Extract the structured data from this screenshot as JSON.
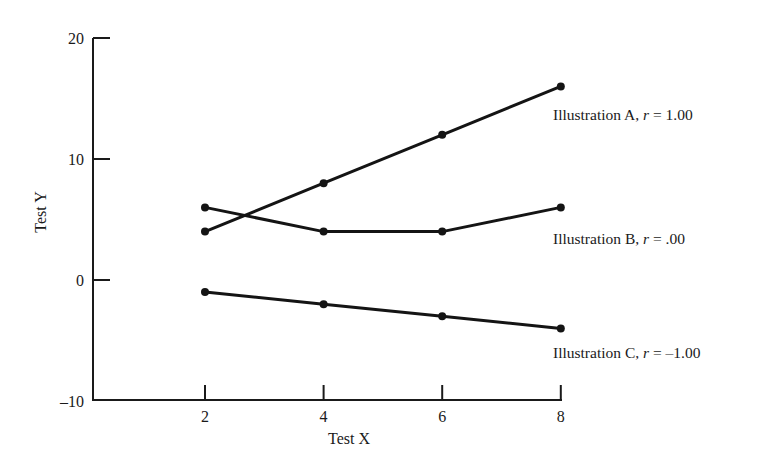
{
  "chart_data": {
    "type": "line",
    "title": "",
    "xlabel": "Test X",
    "ylabel": "Test Y",
    "x": [
      2,
      4,
      6,
      8
    ],
    "xticks": [
      2,
      4,
      6,
      8
    ],
    "yticks": [
      -10,
      0,
      10,
      20
    ],
    "xlim": [
      0,
      8
    ],
    "ylim": [
      -10,
      20
    ],
    "grid": false,
    "legend_position": "inline-right",
    "series": [
      {
        "name": "Illustration A",
        "r_label": "r",
        "r_value": "1.00",
        "values": [
          4,
          8,
          12,
          16
        ]
      },
      {
        "name": "Illustration B",
        "r_label": "r",
        "r_value": ".00",
        "values": [
          6,
          4,
          4,
          6
        ]
      },
      {
        "name": "Illustration C",
        "r_label": "r",
        "r_value": "–1.00",
        "values": [
          -1,
          -2,
          -3,
          -4
        ]
      }
    ]
  },
  "labels": {
    "series_a": {
      "prefix": "Illustration A, ",
      "r": "r",
      "suffix": " = 1.00"
    },
    "series_b": {
      "prefix": "Illustration B, ",
      "r": "r",
      "suffix": " = .00"
    },
    "series_c": {
      "prefix": "Illustration C, ",
      "r": "r",
      "suffix": " = –1.00"
    }
  },
  "colors": {
    "ink": "#141414",
    "background": "#ffffff"
  }
}
